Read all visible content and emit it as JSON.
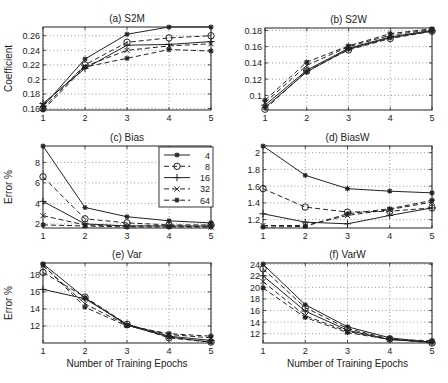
{
  "figure": {
    "xlabel": "Number of Training Epochs",
    "legend": {
      "title": "",
      "entries": [
        {
          "label": "4",
          "style": "solid",
          "marker": "star"
        },
        {
          "label": "8",
          "style": "dashed",
          "marker": "circle"
        },
        {
          "label": "16",
          "style": "solid",
          "marker": "plus"
        },
        {
          "label": "32",
          "style": "dashed",
          "marker": "x"
        },
        {
          "label": "64",
          "style": "dashed",
          "marker": "star"
        }
      ]
    }
  },
  "chart_data": [
    {
      "type": "line",
      "title": "(a) S2M",
      "xlabel": "",
      "ylabel": "Coefficient",
      "x": [
        1,
        2,
        3,
        4,
        5
      ],
      "xticks": [
        "1",
        "2",
        "3",
        "4",
        "5"
      ],
      "yticks": [
        "0.16",
        "0.18",
        "0.2",
        "0.22",
        "0.24",
        "0.26"
      ],
      "ytick_values": [
        0.16,
        0.18,
        0.2,
        0.22,
        0.24,
        0.26
      ],
      "ylim": [
        0.158,
        0.272
      ],
      "grid": true,
      "series": [
        {
          "name": "4",
          "values": [
            0.163,
            0.228,
            0.262,
            0.272,
            0.272
          ]
        },
        {
          "name": "8",
          "values": [
            0.16,
            0.22,
            0.251,
            0.257,
            0.26
          ]
        },
        {
          "name": "16",
          "values": [
            0.167,
            0.215,
            0.247,
            0.248,
            0.252
          ]
        },
        {
          "name": "32",
          "values": [
            0.165,
            0.218,
            0.24,
            0.246,
            0.249
          ]
        },
        {
          "name": "64",
          "values": [
            0.158,
            0.217,
            0.229,
            0.241,
            0.239
          ]
        }
      ]
    },
    {
      "type": "line",
      "title": "(b) S2W",
      "xlabel": "",
      "ylabel": "",
      "x": [
        1,
        2,
        3,
        4,
        5
      ],
      "xticks": [
        "1",
        "2",
        "3",
        "4",
        "5"
      ],
      "yticks": [
        "0.1",
        "0.12",
        "0.14",
        "0.16",
        "0.18"
      ],
      "ytick_values": [
        0.1,
        0.12,
        0.14,
        0.16,
        0.18
      ],
      "ylim": [
        0.082,
        0.183
      ],
      "grid": true,
      "series": [
        {
          "name": "4",
          "values": [
            0.085,
            0.129,
            0.157,
            0.171,
            0.179
          ]
        },
        {
          "name": "8",
          "values": [
            0.083,
            0.13,
            0.156,
            0.17,
            0.179
          ]
        },
        {
          "name": "16",
          "values": [
            0.088,
            0.131,
            0.158,
            0.172,
            0.18
          ]
        },
        {
          "name": "32",
          "values": [
            0.091,
            0.137,
            0.16,
            0.174,
            0.181
          ]
        },
        {
          "name": "64",
          "values": [
            0.094,
            0.141,
            0.161,
            0.176,
            0.182
          ]
        }
      ]
    },
    {
      "type": "line",
      "title": "(c) Bias",
      "xlabel": "",
      "ylabel": "Error %",
      "x": [
        1,
        2,
        3,
        4,
        5
      ],
      "xticks": [
        "1",
        "2",
        "3",
        "4",
        "5"
      ],
      "yticks": [
        "2",
        "4",
        "6",
        "8"
      ],
      "ytick_values": [
        2,
        4,
        6,
        8
      ],
      "ylim": [
        1.6,
        9.6
      ],
      "grid": true,
      "legend_position": "upper right",
      "series": [
        {
          "name": "4",
          "values": [
            9.6,
            3.6,
            2.7,
            2.3,
            2.1
          ]
        },
        {
          "name": "8",
          "values": [
            6.6,
            2.5,
            2.1,
            1.9,
            1.9
          ]
        },
        {
          "name": "16",
          "values": [
            4.2,
            2.0,
            1.8,
            1.8,
            1.8
          ]
        },
        {
          "name": "32",
          "values": [
            2.8,
            1.9,
            1.8,
            1.8,
            1.7
          ]
        },
        {
          "name": "64",
          "values": [
            1.9,
            1.8,
            1.7,
            1.7,
            1.7
          ]
        }
      ]
    },
    {
      "type": "line",
      "title": "(d) BiasW",
      "xlabel": "",
      "ylabel": "",
      "x": [
        1,
        2,
        3,
        4,
        5
      ],
      "xticks": [
        "1",
        "2",
        "3",
        "4",
        "5"
      ],
      "yticks": [
        "1.2",
        "1.4",
        "1.6",
        "1.8",
        "2"
      ],
      "ytick_values": [
        1.2,
        1.4,
        1.6,
        1.8,
        2.0
      ],
      "ylim": [
        1.1,
        2.08
      ],
      "grid": true,
      "series": [
        {
          "name": "4",
          "values": [
            2.08,
            1.73,
            1.57,
            1.54,
            1.52
          ]
        },
        {
          "name": "8",
          "values": [
            1.57,
            1.35,
            1.29,
            1.3,
            1.34
          ]
        },
        {
          "name": "16",
          "values": [
            1.27,
            1.17,
            1.15,
            1.25,
            1.34
          ]
        },
        {
          "name": "32",
          "values": [
            1.13,
            1.13,
            1.25,
            1.32,
            1.41
          ]
        },
        {
          "name": "64",
          "values": [
            1.11,
            1.12,
            1.27,
            1.33,
            1.43
          ]
        }
      ]
    },
    {
      "type": "line",
      "title": "(e) Var",
      "xlabel": "Number of Training Epochs",
      "ylabel": "Error %",
      "x": [
        1,
        2,
        3,
        4,
        5
      ],
      "xticks": [
        "1",
        "2",
        "3",
        "4",
        "5"
      ],
      "yticks": [
        "12",
        "14",
        "16",
        "18"
      ],
      "ytick_values": [
        12,
        14,
        16,
        18
      ],
      "ylim": [
        10.0,
        19.4
      ],
      "grid": true,
      "series": [
        {
          "name": "4",
          "values": [
            19.3,
            15.3,
            12.1,
            10.7,
            10.1
          ]
        },
        {
          "name": "8",
          "values": [
            18.3,
            15.4,
            12.2,
            10.6,
            10.1
          ]
        },
        {
          "name": "16",
          "values": [
            16.3,
            15.2,
            12.2,
            10.8,
            10.3
          ]
        },
        {
          "name": "32",
          "values": [
            19.1,
            14.6,
            12.1,
            11.0,
            10.6
          ]
        },
        {
          "name": "64",
          "values": [
            19.2,
            14.2,
            12.0,
            11.1,
            10.8
          ]
        }
      ]
    },
    {
      "type": "line",
      "title": "(f) VarW",
      "xlabel": "Number of Training Epochs",
      "ylabel": "",
      "x": [
        1,
        2,
        3,
        4,
        5
      ],
      "xticks": [
        "1",
        "2",
        "3",
        "4",
        "5"
      ],
      "yticks": [
        "12",
        "14",
        "16",
        "18",
        "20",
        "22",
        "24"
      ],
      "ytick_values": [
        12,
        14,
        16,
        18,
        20,
        22,
        24
      ],
      "ylim": [
        10.4,
        24.2
      ],
      "grid": true,
      "series": [
        {
          "name": "4",
          "values": [
            24.0,
            17.0,
            13.2,
            11.3,
            10.5
          ]
        },
        {
          "name": "8",
          "values": [
            23.2,
            16.5,
            12.9,
            11.1,
            10.4
          ]
        },
        {
          "name": "16",
          "values": [
            22.0,
            15.9,
            12.6,
            11.0,
            10.5
          ]
        },
        {
          "name": "32",
          "values": [
            21.0,
            15.1,
            12.4,
            11.0,
            10.6
          ]
        },
        {
          "name": "64",
          "values": [
            19.9,
            14.8,
            12.2,
            11.0,
            10.8
          ]
        }
      ]
    }
  ]
}
